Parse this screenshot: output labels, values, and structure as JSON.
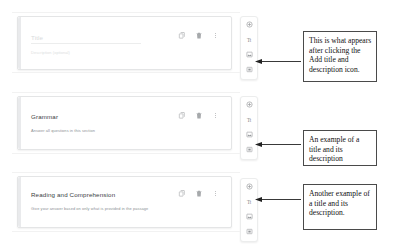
{
  "app": {
    "name": "google-forms-editor",
    "context": "Form section title and description blocks"
  },
  "sections": [
    {
      "id": "section-1",
      "title": "Title",
      "title_is_placeholder": true,
      "description": "Description (optional)",
      "description_is_placeholder": true,
      "actions": {
        "duplicate": "Duplicate",
        "delete": "Delete",
        "more": "More options"
      }
    },
    {
      "id": "section-2",
      "title": "Grammar",
      "title_is_placeholder": false,
      "description": "Answer all questions in this section",
      "description_is_placeholder": false,
      "actions": {
        "duplicate": "Duplicate",
        "delete": "Delete",
        "more": "More options"
      }
    },
    {
      "id": "section-3",
      "title": "Reading and Comprehension",
      "title_is_placeholder": false,
      "description": "Give your answer based on only what is provided in the passage",
      "description_is_placeholder": false,
      "actions": {
        "duplicate": "Duplicate",
        "delete": "Delete",
        "more": "More options"
      }
    }
  ],
  "toolbar": {
    "buttons": [
      {
        "icon": "add-circle-icon",
        "label": "Add question"
      },
      {
        "icon": "title-description-icon",
        "label": "Tt"
      },
      {
        "icon": "add-image-icon",
        "label": "Add image"
      },
      {
        "icon": "add-video-icon",
        "label": "Add video"
      }
    ]
  },
  "annotations": [
    {
      "id": "annotation-1",
      "text": "This is what appears after clicking the Add title and description icon."
    },
    {
      "id": "annotation-2",
      "text": "An example of a title and its description"
    },
    {
      "id": "annotation-3",
      "text": "Another example of a title and its description."
    }
  ],
  "colors": {
    "card_background": "#ffffff",
    "card_border": "#e4e5e6",
    "title_text": "#3c4043",
    "description_text": "#8a8f94",
    "placeholder_text": "#dcdee0",
    "annotation_border": "#4a4a4a",
    "annotation_text": "#111111",
    "icon": "#5f6368"
  }
}
